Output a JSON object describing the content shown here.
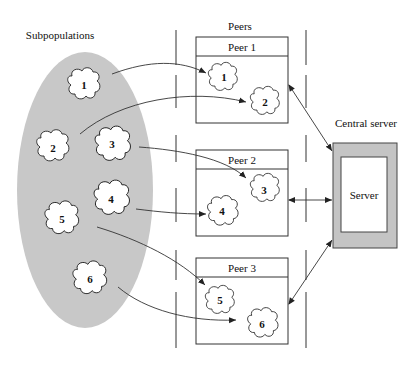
{
  "labels": {
    "subpopulations": "Subpopulations",
    "peers": "Peers",
    "central_server": "Central server",
    "server": "Server"
  },
  "peers": [
    {
      "label": "Peer 1",
      "subpops": [
        "1",
        "2"
      ]
    },
    {
      "label": "Peer 2",
      "subpops": [
        "3",
        "4"
      ]
    },
    {
      "label": "Peer 3",
      "subpops": [
        "5",
        "6"
      ]
    }
  ],
  "subpopulations": [
    "1",
    "2",
    "3",
    "4",
    "5",
    "6"
  ],
  "colors": {
    "ellipse_fill": "#c8c8c8",
    "server_frame": "#c4c4c4",
    "stroke": "#333333"
  }
}
